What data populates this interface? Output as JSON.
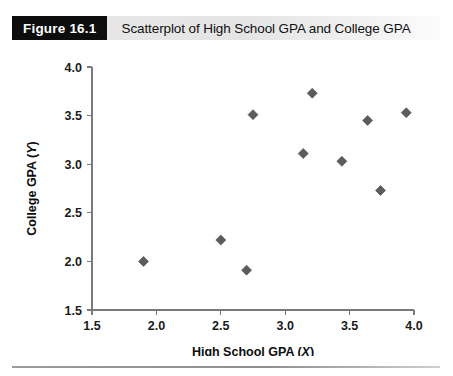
{
  "figure": {
    "badge_label": "Figure 16.1",
    "caption": "Scatterplot of High School GPA and College GPA"
  },
  "colors": {
    "badge_background": "#0d0d0d",
    "badge_text": "#ffffff",
    "caption_band": "#e7e7e7",
    "marker": "#5c5c5c",
    "axis": "#7a7a7a",
    "rule": "#8f8f8f"
  },
  "chart_data": {
    "type": "scatter",
    "title": "Scatterplot of High School GPA and College GPA",
    "xlabel": "High School GPA (X)",
    "ylabel": "College GPA (Y)",
    "xlim": [
      1.5,
      4.0
    ],
    "ylim": [
      1.5,
      4.0
    ],
    "xticks": [
      "1.5",
      "2.0",
      "2.5",
      "3.0",
      "3.5",
      "4.0"
    ],
    "yticks": [
      "1.5",
      "2.0",
      "2.5",
      "3.0",
      "3.5",
      "4.0"
    ],
    "xtick_values": [
      1.5,
      2.0,
      2.5,
      3.0,
      3.5,
      4.0
    ],
    "ytick_values": [
      1.5,
      2.0,
      2.5,
      3.0,
      3.5,
      4.0
    ],
    "grid": false,
    "legend": false,
    "marker_shape": "diamond",
    "x": [
      1.9,
      2.5,
      2.7,
      2.75,
      3.14,
      3.21,
      3.44,
      3.64,
      3.74,
      3.94
    ],
    "y": [
      2.0,
      2.22,
      1.91,
      3.51,
      3.11,
      3.73,
      3.03,
      3.45,
      2.73,
      3.53
    ],
    "points": [
      {
        "x": 1.9,
        "y": 2.0
      },
      {
        "x": 2.5,
        "y": 2.22
      },
      {
        "x": 2.7,
        "y": 1.91
      },
      {
        "x": 2.75,
        "y": 3.51
      },
      {
        "x": 3.14,
        "y": 3.11
      },
      {
        "x": 3.21,
        "y": 3.73
      },
      {
        "x": 3.44,
        "y": 3.03
      },
      {
        "x": 3.64,
        "y": 3.45
      },
      {
        "x": 3.74,
        "y": 2.73
      },
      {
        "x": 3.94,
        "y": 3.53
      }
    ]
  }
}
